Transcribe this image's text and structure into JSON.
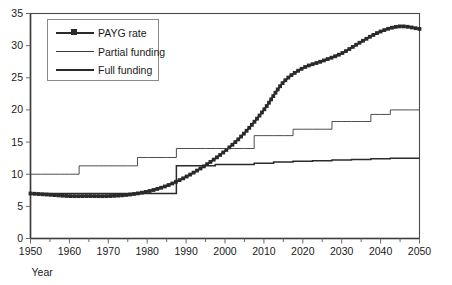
{
  "chart_data": {
    "type": "line",
    "title": "",
    "clipped_header_text": "(percentage)",
    "xlabel": "Year",
    "ylabel": "",
    "xlim": [
      1950,
      2050
    ],
    "ylim": [
      0,
      35
    ],
    "xticks": [
      1950,
      1960,
      1970,
      1980,
      1990,
      2000,
      2010,
      2020,
      2030,
      2040,
      2050
    ],
    "xminor_step": 5,
    "yticks": [
      0,
      5,
      10,
      15,
      20,
      25,
      30,
      35
    ],
    "grid": false,
    "legend_position": "upper-left",
    "x": [
      1950,
      1955,
      1960,
      1965,
      1970,
      1975,
      1980,
      1985,
      1990,
      1995,
      2000,
      2005,
      2010,
      2015,
      2020,
      2025,
      2030,
      2035,
      2040,
      2045,
      2050
    ],
    "series": [
      {
        "name": "PAYG rate",
        "style": "thick-marker",
        "color": "#2a2a2a",
        "values": [
          7.0,
          6.8,
          6.6,
          6.6,
          6.6,
          6.8,
          7.3,
          8.2,
          9.6,
          11.4,
          13.6,
          16.4,
          20.0,
          24.3,
          26.5,
          27.6,
          28.8,
          30.6,
          32.2,
          33.0,
          32.6
        ]
      },
      {
        "name": "Partial funding",
        "style": "thin-step",
        "color": "#3a3a3a",
        "values": [
          10.0,
          10.0,
          10.0,
          11.3,
          11.3,
          11.3,
          12.6,
          12.6,
          14.0,
          14.0,
          14.0,
          14.0,
          16.0,
          16.0,
          17.0,
          17.0,
          18.2,
          18.2,
          19.3,
          20.0,
          20.0
        ]
      },
      {
        "name": "Full funding",
        "style": "medium-step",
        "color": "#2a2a2a",
        "values": [
          7.0,
          7.0,
          7.0,
          7.0,
          7.0,
          7.0,
          7.0,
          7.0,
          11.3,
          11.3,
          11.5,
          11.5,
          11.7,
          11.9,
          12.0,
          12.1,
          12.2,
          12.3,
          12.4,
          12.5,
          12.5
        ]
      }
    ]
  },
  "legend": {
    "items": [
      {
        "label": "PAYG rate"
      },
      {
        "label": "Partial funding"
      },
      {
        "label": "Full funding"
      }
    ]
  },
  "axis": {
    "x_title": "Year"
  }
}
